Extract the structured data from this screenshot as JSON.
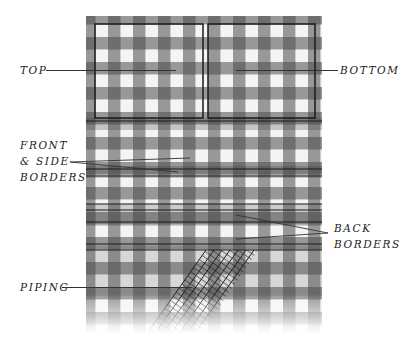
{
  "diagram": {
    "labels": {
      "top": "TOP",
      "bottom": "BOTTOM",
      "front_side_borders": [
        "FRONT",
        "& SIDE",
        "BORDERS"
      ],
      "back_borders": [
        "BACK",
        "BORDERS"
      ],
      "piping": "PIPING"
    },
    "colors": {
      "dark_check": "#7a7a7a",
      "light_check": "#f2f2f2",
      "outline": "#1a1a1a",
      "text": "#222222"
    }
  }
}
